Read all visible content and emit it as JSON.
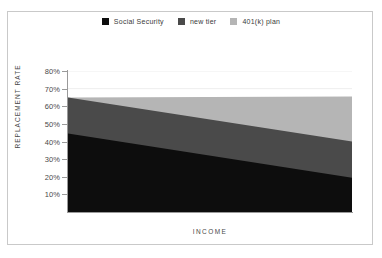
{
  "chart_data": {
    "type": "area",
    "stacked": true,
    "title": "",
    "xlabel": "INCOME",
    "ylabel": "REPLACEMENT RATE",
    "x": [
      0,
      100
    ],
    "ylim": [
      0,
      80
    ],
    "ytick_labels": [
      "80%",
      "70%",
      "60%",
      "50%",
      "40%",
      "30%",
      "20%",
      "10%"
    ],
    "ytick_values": [
      80,
      70,
      60,
      50,
      40,
      30,
      20,
      10
    ],
    "xtick_labels": [],
    "grid": "horizontal-faint",
    "legend_position": "top-center",
    "series": [
      {
        "name": "Social Security",
        "color": "#0d0d0d",
        "values": [
          44.5,
          19.5
        ]
      },
      {
        "name": "new tier",
        "color": "#4a4a4a",
        "values": [
          20.5,
          20.5
        ]
      },
      {
        "name": "401(k) plan",
        "color": "#b5b5b5",
        "values": [
          0.0,
          25.5
        ]
      }
    ],
    "cumulative_top_edges": {
      "social_security": [
        44.5,
        19.5
      ],
      "social_security_plus_new_tier": [
        65.0,
        40.0
      ],
      "total": [
        65.0,
        65.5
      ]
    }
  },
  "legend": {
    "items": [
      {
        "label": "Social Security",
        "color": "#0d0d0d"
      },
      {
        "label": "new tier",
        "color": "#4a4a4a"
      },
      {
        "label": "401(k) plan",
        "color": "#b5b5b5"
      }
    ]
  },
  "axes": {
    "y_title": "REPLACEMENT RATE",
    "x_title": "INCOME",
    "y_ticks": [
      {
        "label": "80%",
        "value": 80
      },
      {
        "label": "70%",
        "value": 70
      },
      {
        "label": "60%",
        "value": 60
      },
      {
        "label": "50%",
        "value": 50
      },
      {
        "label": "40%",
        "value": 40
      },
      {
        "label": "30%",
        "value": 30
      },
      {
        "label": "20%",
        "value": 20
      },
      {
        "label": "10%",
        "value": 10
      }
    ]
  },
  "style": {
    "frame_color": "#c9c9c9",
    "axis_color": "#9a9a9a",
    "grid_color": "#eeeeee",
    "text_color": "#4a4a4a",
    "background": "#ffffff"
  }
}
